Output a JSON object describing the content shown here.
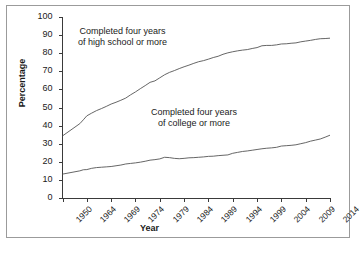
{
  "chart_data": {
    "type": "line",
    "title": "",
    "xlabel": "Year",
    "ylabel": "Percentage",
    "ylim": [
      0,
      100
    ],
    "ytick_labels": [
      "0",
      "10",
      "20",
      "30",
      "40",
      "50",
      "60",
      "70",
      "80",
      "90",
      "100"
    ],
    "ytick_values": [
      0,
      10,
      20,
      30,
      40,
      50,
      60,
      70,
      80,
      90,
      100
    ],
    "xtick_labels": [
      "1950",
      "1964",
      "1969",
      "1974",
      "1979",
      "1984",
      "1989",
      "1994",
      "1999",
      "2004",
      "2009",
      "2014"
    ],
    "xtick_values": [
      1950,
      1964,
      1969,
      1974,
      1979,
      1984,
      1989,
      1994,
      1999,
      2004,
      2009,
      2014
    ],
    "grid": false,
    "legend_position": "inline-annotations",
    "annotations": [
      {
        "name": "high-school-annotation",
        "line1": "Completed four years",
        "line2": "of high school or more"
      },
      {
        "name": "college-annotation",
        "line1": "Completed four years",
        "line2": "of college or more"
      }
    ],
    "x": [
      1950,
      1960,
      1962,
      1964,
      1965,
      1966,
      1967,
      1968,
      1969,
      1970,
      1971,
      1972,
      1973,
      1974,
      1975,
      1976,
      1977,
      1978,
      1979,
      1980,
      1981,
      1982,
      1983,
      1984,
      1985,
      1986,
      1987,
      1988,
      1989,
      1990,
      1991,
      1992,
      1993,
      1994,
      1995,
      1996,
      1997,
      1998,
      1999,
      2000,
      2001,
      2002,
      2003,
      2004,
      2005,
      2006,
      2007,
      2008,
      2009,
      2010,
      2011,
      2012,
      2013,
      2014
    ],
    "series": [
      {
        "name": "Completed four years of high school or more",
        "color": "#555555",
        "values": [
          34.3,
          41.1,
          43.2,
          45.4,
          46.9,
          48.3,
          49.4,
          50.6,
          51.9,
          52.9,
          54.0,
          55.2,
          57.0,
          58.6,
          60.4,
          62.1,
          63.9,
          64.7,
          66.4,
          68.1,
          69.4,
          70.4,
          71.5,
          72.5,
          73.4,
          74.4,
          75.3,
          75.9,
          76.7,
          77.6,
          78.3,
          79.4,
          80.2,
          80.8,
          81.3,
          81.7,
          82.0,
          82.6,
          83.1,
          84.1,
          84.3,
          84.3,
          84.6,
          85.1,
          85.2,
          85.5,
          85.7,
          86.3,
          86.7,
          87.1,
          87.6,
          88.0,
          88.1,
          88.3
        ]
      },
      {
        "name": "Completed four years of college or more",
        "color": "#555555",
        "values": [
          13.2,
          15.0,
          15.6,
          15.7,
          16.4,
          16.8,
          17.0,
          17.2,
          17.4,
          17.8,
          18.2,
          18.8,
          19.1,
          19.4,
          19.8,
          20.3,
          20.9,
          21.2,
          21.6,
          22.5,
          22.3,
          21.9,
          21.7,
          21.9,
          22.2,
          22.3,
          22.5,
          22.7,
          23.0,
          23.1,
          23.4,
          23.6,
          23.8,
          24.7,
          25.2,
          25.7,
          26.0,
          26.4,
          26.8,
          27.2,
          27.5,
          27.7,
          28.0,
          28.7,
          28.9,
          29.1,
          29.4,
          30.0,
          30.6,
          31.4,
          32.0,
          32.6,
          33.6,
          34.7
        ]
      }
    ]
  }
}
